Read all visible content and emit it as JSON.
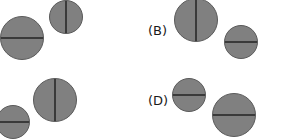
{
  "figure": {
    "title": "",
    "background_color": "#ffffff",
    "circle_fill_color": "#808080",
    "circle_stroke_color": "#5a5a5a",
    "divider_color": "#3a3a3a",
    "label_color": "#1a1a1a"
  },
  "labels": [
    {
      "text": "(B)",
      "x": 148,
      "y": 24
    },
    {
      "text": "(D)",
      "x": 148,
      "y": 94
    }
  ],
  "circles": [
    {
      "id": "circle-a-large",
      "group": "A",
      "orientation": "horizontal",
      "center_x": 22,
      "center_y": 38,
      "radius": 22
    },
    {
      "id": "circle-a-small",
      "group": "A",
      "orientation": "vertical",
      "center_x": 66,
      "center_y": 17,
      "radius": 17
    },
    {
      "id": "circle-b-large",
      "group": "B",
      "orientation": "vertical",
      "center_x": 196,
      "center_y": 20,
      "radius": 22
    },
    {
      "id": "circle-b-small",
      "group": "B",
      "orientation": "horizontal",
      "center_x": 241,
      "center_y": 42,
      "radius": 17
    },
    {
      "id": "circle-c-small",
      "group": "C",
      "orientation": "horizontal",
      "center_x": 13,
      "center_y": 122,
      "radius": 17
    },
    {
      "id": "circle-c-large",
      "group": "C",
      "orientation": "vertical",
      "center_x": 55,
      "center_y": 100,
      "radius": 22
    },
    {
      "id": "circle-d-small",
      "group": "D",
      "orientation": "horizontal",
      "center_x": 189,
      "center_y": 95,
      "radius": 17
    },
    {
      "id": "circle-d-large",
      "group": "D",
      "orientation": "horizontal",
      "center_x": 234,
      "center_y": 115,
      "radius": 22
    }
  ]
}
